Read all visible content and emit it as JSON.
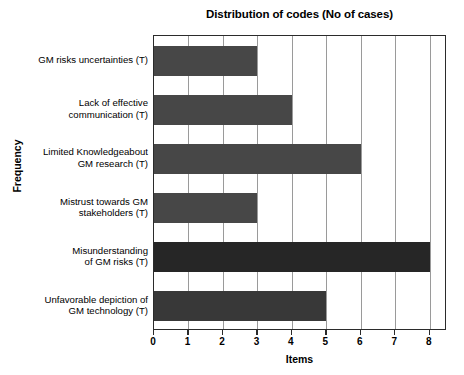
{
  "chart_data": {
    "type": "bar",
    "orientation": "horizontal",
    "title": "Distribution of codes (No of cases)",
    "xlabel": "Items",
    "ylabel": "Frequency",
    "xlim": [
      0,
      8.5
    ],
    "xticks": [
      0,
      1,
      2,
      3,
      4,
      5,
      6,
      7,
      8
    ],
    "xtick_labels": [
      "0",
      "1",
      "2",
      "3",
      "4",
      "5",
      "6",
      "7",
      "8"
    ],
    "grid": "vertical",
    "legend": "none",
    "categories": [
      "GM risks uncertainties (T)",
      "Lack of effective communication (T)",
      "Limited Knowledgeabout GM research (T)",
      "Mistrust towards GM stakeholders (T)",
      "Misunderstanding of GM risks (T)",
      "Unfavorable depiction of GM technology (T)"
    ],
    "category_lines": [
      [
        "GM risks uncertainties (T)"
      ],
      [
        "Lack of effective",
        "communication (T)"
      ],
      [
        "Limited Knowledgeabout",
        "GM research (T)"
      ],
      [
        "Mistrust towards GM",
        "stakeholders (T)"
      ],
      [
        "Misunderstanding",
        "of GM risks (T)"
      ],
      [
        "Unfavorable depiction of",
        "GM technology (T)"
      ]
    ],
    "values": [
      3,
      4,
      6,
      3,
      8,
      5
    ],
    "bar_colors": [
      "#474747",
      "#474747",
      "#474747",
      "#474747",
      "#262626",
      "#383838"
    ],
    "colors": {
      "axis": "#2b2b2b",
      "gridline": "#9a9a9a",
      "background": "#ffffff",
      "text": "#000000",
      "bar_default": "#474747",
      "bar_max": "#262626"
    }
  }
}
